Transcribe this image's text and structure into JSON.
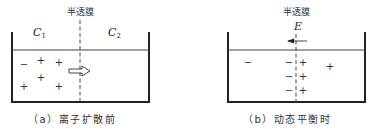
{
  "panels": [
    {
      "id": "a",
      "membrane_label": "半透膜",
      "left_label": "C",
      "left_sub": "1",
      "right_label": "C",
      "right_sub": "2",
      "caption": "（a）离子扩散前",
      "arrow": "diffusion-right"
    },
    {
      "id": "b",
      "membrane_label": "半透膜",
      "field_label": "E",
      "caption": "（b）动态平衡时",
      "arrow": "field-left"
    }
  ],
  "signs": {
    "minus": "−",
    "plus": "+"
  }
}
